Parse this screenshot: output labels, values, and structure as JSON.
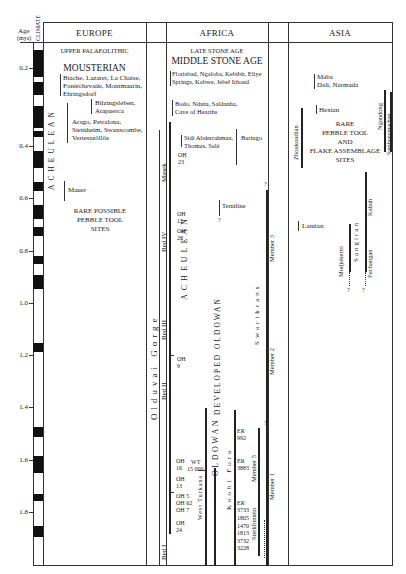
{
  "header": {
    "age_label": "Age",
    "age_unit": "(myа)",
    "climate_label": "CLIMATE",
    "regions": [
      "EUROPE",
      "AFRICA",
      "ASIA"
    ]
  },
  "axis": {
    "ticks": [
      "0.2",
      "0.4",
      "0.6",
      "0.8",
      "1.0",
      "1.2",
      "1.4",
      "1.6",
      "1.8"
    ]
  },
  "europe": {
    "upper_palaeolithic": "UPPER PALAEOLITHIC",
    "mousterian": "MOUSTERIAN",
    "sites_1": [
      "Biache, Lazaret, La Chaise,",
      "Fontéchevade, Montmaurin,",
      "Ehringsdorf"
    ],
    "sites_2": [
      "Bilzingsleben,",
      "Atapuerca"
    ],
    "sites_3": [
      "Arago, Petralona,",
      "Steinheim, Swanscombe,",
      "Vertesszöllös"
    ],
    "mauer": "Mauer",
    "acheulean": "ACHEULEAN",
    "rare": [
      "RARE POSSIBLE",
      "PEBBLE TOOL",
      "SITES"
    ]
  },
  "africa": {
    "late_stone_age": "LATE STONE AGE",
    "middle_stone_age": "MIDDLE STONE AGE",
    "sites_1": [
      "Florisbad, Ngaloba, Kebibit, Eliye",
      "Springs, Kabwe, Jebel Irhoud"
    ],
    "sites_2": [
      "Bodo, Ndutu, Saldanha,",
      "Cave of Hearths"
    ],
    "sites_3": [
      "Sidi Abderrahman,",
      "Thomas, Salé"
    ],
    "baringo": "Baringo",
    "ternifine": "Ternifine",
    "olduvai_gorge": "Olduvai Gorge",
    "beds": [
      "Masek",
      "Bed IV",
      "Bed III",
      "Bed II",
      "Bed I"
    ],
    "oh_labels": [
      {
        "text": "OH\n23"
      },
      {
        "text": "OH\n12"
      },
      {
        "text": "OH\n28"
      },
      {
        "text": "OH\n9"
      },
      {
        "text": "OH\n16"
      },
      {
        "text": "OH\n13"
      },
      {
        "text": "OH 5\nOH 62\nOH 7"
      },
      {
        "text": "OH\n24"
      }
    ],
    "acheulean": "ACHEULEAN",
    "developed_oldowan": "DEVELOPED OLDOWAN",
    "oldowan": "OLDOWAN",
    "west_turkana": "West Turkana",
    "wt_label": [
      "WT",
      "15 000"
    ],
    "koobi_fora": "Koobi Fora",
    "er_labels": [
      {
        "text": "ER\n992"
      },
      {
        "text": "ER\n3883"
      },
      {
        "text": "ER\n3733"
      },
      {
        "text": "1805\n1470\n1813\n3732\n3228"
      }
    ],
    "swartkrans": "Swartkrans",
    "members": [
      "Member 3",
      "Member 2",
      "Member 1"
    ],
    "sterkfontein": "Sterkfontein",
    "member_5": "Member 5",
    "question": "?"
  },
  "asia": {
    "sites_1": [
      "Maba",
      "Dali, Narmada"
    ],
    "hexian": "Hexian",
    "zhoukoudian": "Zhoukoudian",
    "ngandong": "Ngandong",
    "sambungmachan": "Sambungmachan",
    "rare": [
      "RARE",
      "PEBBLE TOOL",
      "AND",
      "FLAKE ASSEMBLAGE",
      "SITES"
    ],
    "lantian": "Lantian",
    "modjokerto": "Modjokerto",
    "sangiran": "Sangiran",
    "kabuh": "Kabuh",
    "puchangan": "Puchangan",
    "question": "?"
  }
}
